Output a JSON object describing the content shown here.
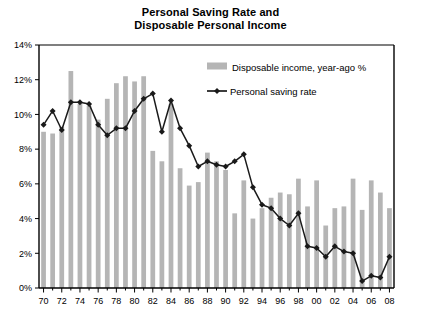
{
  "chart_data": {
    "type": "bar",
    "title": "Personal Saving Rate and Disposable Personal Income",
    "title_line1": "Personal Saving Rate and",
    "title_line2": "Disposable Personal Income",
    "xlabel": "",
    "ylabel": "",
    "ylim": [
      0,
      14
    ],
    "ytick_values": [
      0,
      2,
      4,
      6,
      8,
      10,
      12,
      14
    ],
    "ytick_labels": [
      "0%",
      "2%",
      "4%",
      "6%",
      "8%",
      "10%",
      "12%",
      "14%"
    ],
    "grid": false,
    "legend_position": "upper-right-inside",
    "x": [
      1970,
      1971,
      1972,
      1973,
      1974,
      1975,
      1976,
      1977,
      1978,
      1979,
      1980,
      1981,
      1982,
      1983,
      1984,
      1985,
      1986,
      1987,
      1988,
      1989,
      1990,
      1991,
      1992,
      1993,
      1994,
      1995,
      1996,
      1997,
      1998,
      1999,
      2000,
      2001,
      2002,
      2003,
      2004,
      2005,
      2006,
      2007,
      2008
    ],
    "xtick_labels": [
      "70",
      "72",
      "74",
      "76",
      "78",
      "80",
      "82",
      "84",
      "86",
      "88",
      "90",
      "92",
      "94",
      "96",
      "98",
      "00",
      "02",
      "04",
      "06",
      "08"
    ],
    "xtick_years": [
      1970,
      1972,
      1974,
      1976,
      1978,
      1980,
      1982,
      1984,
      1986,
      1988,
      1990,
      1992,
      1994,
      1996,
      1998,
      2000,
      2002,
      2004,
      2006,
      2008
    ],
    "series": [
      {
        "name": "Disposable income, year-ago %",
        "type": "bar",
        "color": "#b5b5b5",
        "values": [
          9.0,
          8.9,
          9.3,
          12.5,
          10.6,
          10.5,
          9.7,
          10.9,
          11.8,
          12.2,
          11.9,
          12.2,
          7.9,
          7.3,
          10.6,
          6.9,
          5.9,
          6.1,
          7.8,
          7.3,
          6.8,
          4.3,
          6.2,
          4.0,
          4.6,
          5.2,
          5.5,
          5.4,
          6.3,
          4.7,
          6.2,
          3.6,
          4.6,
          4.7,
          6.3,
          4.5,
          6.2,
          5.5,
          4.6
        ]
      },
      {
        "name": "Personal saving rate",
        "type": "line",
        "color": "#1a1a1a",
        "marker": "diamond",
        "values": [
          9.4,
          10.2,
          9.1,
          10.7,
          10.7,
          10.6,
          9.4,
          8.8,
          9.2,
          9.2,
          10.2,
          10.9,
          11.2,
          9.0,
          10.8,
          9.2,
          8.2,
          7.0,
          7.3,
          7.1,
          7.0,
          7.3,
          7.7,
          5.8,
          4.8,
          4.6,
          4.0,
          3.6,
          4.3,
          2.4,
          2.3,
          1.8,
          2.4,
          2.1,
          2.0,
          0.4,
          0.7,
          0.6,
          1.8
        ]
      }
    ],
    "legend": [
      {
        "label": "Disposable income, year-ago %",
        "marker": "bar-swatch",
        "color": "#b5b5b5"
      },
      {
        "label": "Personal saving rate",
        "marker": "line-diamond",
        "color": "#1a1a1a"
      }
    ],
    "axis": {
      "line_color": "#000000",
      "tick_color": "#000000"
    }
  }
}
